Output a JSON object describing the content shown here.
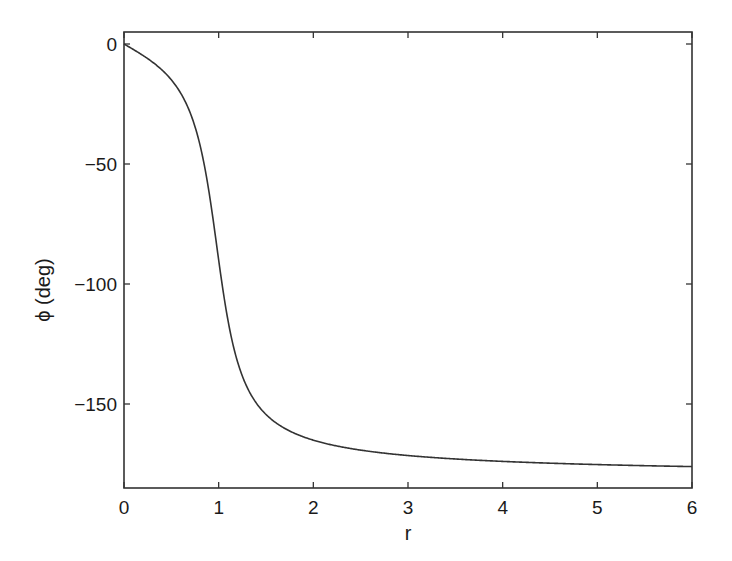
{
  "chart_data": {
    "type": "line",
    "title": "",
    "xlabel": "r",
    "ylabel": "ϕ (deg)",
    "xlim": [
      0,
      6
    ],
    "ylim": [
      -185,
      5
    ],
    "grid": false,
    "legend": null,
    "x_ticks": [
      0,
      1,
      2,
      3,
      4,
      5,
      6
    ],
    "x_tick_labels": [
      "0",
      "1",
      "2",
      "3",
      "4",
      "5",
      "6"
    ],
    "y_ticks": [
      0,
      -50,
      -100,
      -150
    ],
    "y_tick_labels": [
      "0",
      "−50",
      "−100",
      "−150"
    ],
    "series": [
      {
        "name": "phase",
        "color": "#333333",
        "x": [
          0,
          0.25,
          0.5,
          0.6,
          0.7,
          0.8,
          0.9,
          0.95,
          1.0,
          1.05,
          1.1,
          1.2,
          1.3,
          1.4,
          1.5,
          1.75,
          2.0,
          2.5,
          3.0,
          3.5,
          4.0,
          4.5,
          5.0,
          5.5,
          6.0
        ],
        "values": [
          0,
          -6,
          -15,
          -21,
          -29,
          -42,
          -62,
          -76,
          -90,
          -104,
          -117,
          -132,
          -144,
          -152,
          -157,
          -164,
          -168,
          -171,
          -173,
          -174,
          -175,
          -175.5,
          -176,
          -176,
          -176
        ]
      }
    ]
  },
  "axes_box": {
    "left": 124,
    "top": 32,
    "right": 692,
    "bottom": 488
  },
  "colors": {
    "axis": "#333333",
    "line": "#333333",
    "background": "#ffffff"
  }
}
